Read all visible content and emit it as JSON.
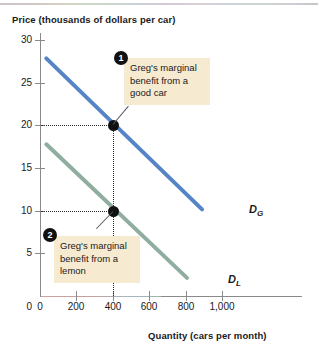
{
  "figure": {
    "title": "",
    "y_axis_title": "Price (thousands of dollars per car)",
    "x_axis_title": "Quantity (cars per month)"
  },
  "chart_data": {
    "type": "line",
    "title": "",
    "xlabel": "Quantity (cars per month)",
    "ylabel": "Price (thousands of dollars per car)",
    "xlim": [
      0,
      1100
    ],
    "ylim": [
      0,
      31
    ],
    "xticks": [
      0,
      200,
      400,
      600,
      800,
      1000
    ],
    "xtick_labels": [
      "0",
      "200",
      "400",
      "600",
      "800",
      "1,000"
    ],
    "yticks": [
      0,
      5,
      10,
      15,
      20,
      25,
      30
    ],
    "ytick_labels": [
      "0",
      "5",
      "10",
      "15",
      "20",
      "25",
      "30"
    ],
    "grid": false,
    "legend": "inline-curve-labels",
    "series": [
      {
        "name": "D_G",
        "label": "D",
        "label_sub": "G",
        "color": "#5585c6",
        "points": [
          [
            30,
            28
          ],
          [
            900,
            10
          ]
        ]
      },
      {
        "name": "D_L",
        "label": "D",
        "label_sub": "L",
        "color": "#8fae9f",
        "points": [
          [
            30,
            18
          ],
          [
            820,
            2
          ]
        ]
      }
    ],
    "markers": [
      {
        "name": "good-car-point",
        "x": 400,
        "y": 20,
        "series": "D_G"
      },
      {
        "name": "lemon-point",
        "x": 400,
        "y": 10,
        "series": "D_L"
      }
    ],
    "guides": [
      {
        "type": "horizontal",
        "value": 20,
        "from_x": 0,
        "to_x": 400
      },
      {
        "type": "horizontal",
        "value": 10,
        "from_x": 0,
        "to_x": 400
      },
      {
        "type": "vertical",
        "value": 400,
        "from_y": 0,
        "to_y": 20
      }
    ],
    "annotations": [
      {
        "number": "1",
        "text": "Greg's marginal benefit from a good car",
        "target": [
          400,
          20
        ]
      },
      {
        "number": "2",
        "text": "Greg's marginal benefit from a lemon",
        "target": [
          400,
          10
        ]
      }
    ]
  },
  "colors": {
    "demand_good": "#5585c6",
    "demand_lemon": "#8fae9f",
    "callout_bg": "#f6ead0",
    "axis": "#8a8a8a",
    "marker": "#111111"
  }
}
